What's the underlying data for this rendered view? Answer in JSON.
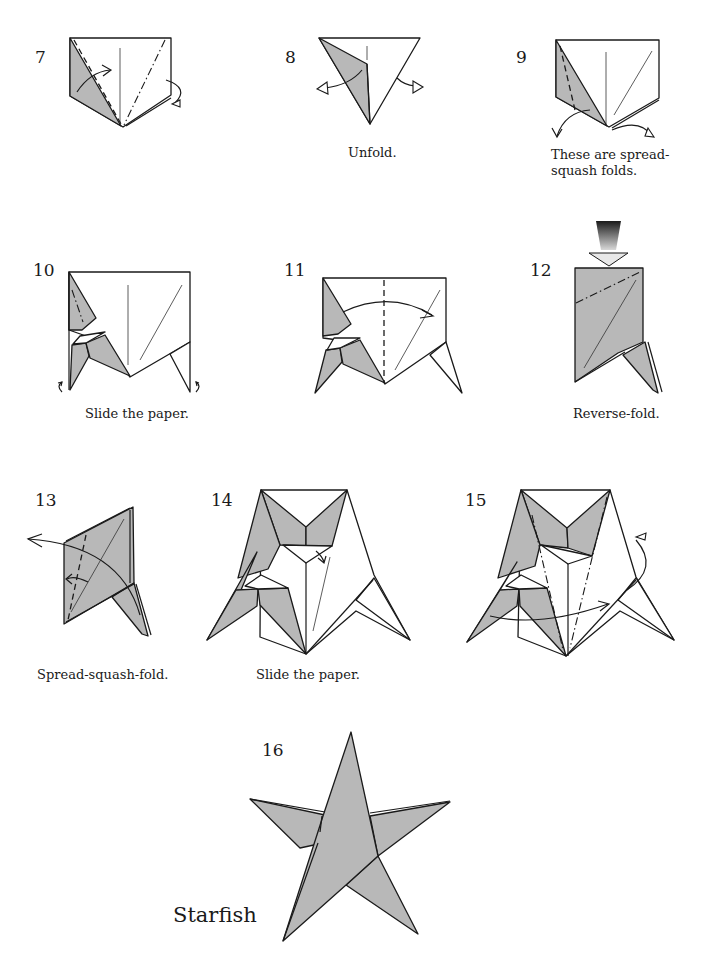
{
  "steps": [
    {
      "number": "7",
      "caption": "",
      "diagram": "valley-fold-left-mountain-fold-right"
    },
    {
      "number": "8",
      "caption": "Unfold.",
      "diagram": "unfold-triangle"
    },
    {
      "number": "9",
      "caption": "These are spread-\nsquash folds.",
      "diagram": "spread-squash-preview"
    },
    {
      "number": "10",
      "caption": "Slide the paper.",
      "diagram": "slide-paper-legs"
    },
    {
      "number": "11",
      "caption": "",
      "diagram": "fold-in-half-valley"
    },
    {
      "number": "12",
      "caption": "Reverse-fold.",
      "diagram": "reverse-fold-push-arrow"
    },
    {
      "number": "13",
      "caption": "Spread-squash-fold.",
      "diagram": "spread-squash-fold"
    },
    {
      "number": "14",
      "caption": "Slide the paper.",
      "diagram": "slide-paper-star-forming"
    },
    {
      "number": "15",
      "caption": "",
      "diagram": "mountain-fold-rotate"
    },
    {
      "number": "16",
      "caption": "",
      "diagram": "finished-star"
    }
  ],
  "final_title": "Starfish",
  "colors": {
    "paper_colored": "#b8b8b8",
    "paper_white": "#ffffff",
    "line": "#1a1a1a"
  }
}
